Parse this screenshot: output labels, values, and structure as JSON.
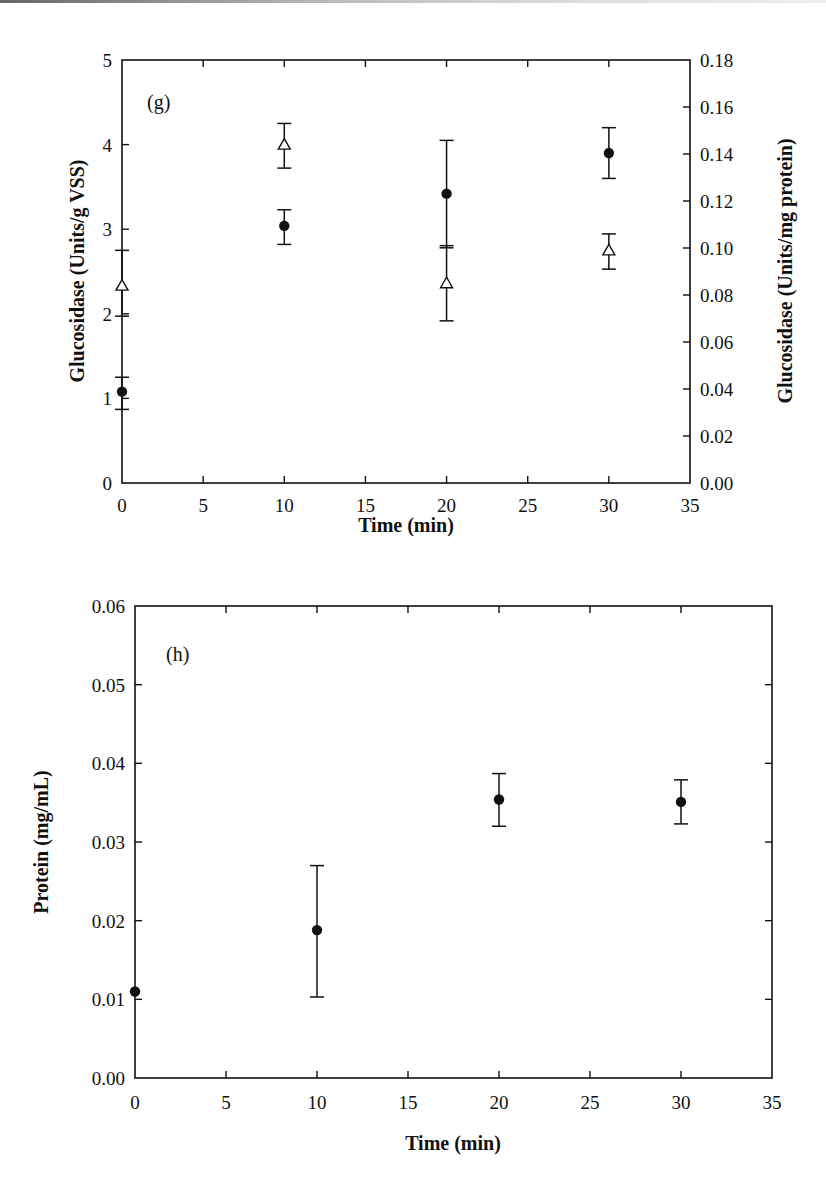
{
  "chart_data": [
    {
      "type": "scatter",
      "panel_label": "(g)",
      "title": "",
      "xlabel": "Time (min)",
      "ylabel": "Glucosidase (Units/g VSS)",
      "y2label": "Glucosidase (Units/mg protein)",
      "xlim": [
        0,
        35
      ],
      "ylim": [
        0,
        5
      ],
      "y2lim": [
        0,
        0.18
      ],
      "x_ticks": [
        "0",
        "5",
        "10",
        "15",
        "20",
        "25",
        "30",
        "35"
      ],
      "y_ticks": [
        "0",
        "1",
        "2",
        "3",
        "4",
        "5"
      ],
      "y2_ticks": [
        "0.00",
        "0.02",
        "0.04",
        "0.06",
        "0.08",
        "0.10",
        "0.12",
        "0.14",
        "0.16",
        "0.18"
      ],
      "grid": false,
      "legend": "none",
      "series": [
        {
          "name": "Glucosidase per g VSS",
          "marker": "filled-circle",
          "axis": "left",
          "x": [
            0,
            10,
            20,
            30
          ],
          "y": [
            1.08,
            3.04,
            3.42,
            3.9
          ],
          "err_high": [
            1.25,
            3.23,
            4.05,
            4.2
          ],
          "err_low": [
            0.87,
            2.82,
            2.78,
            3.6
          ]
        },
        {
          "name": "Glucosidase per mg protein",
          "marker": "open-triangle",
          "axis": "right",
          "x": [
            0,
            10,
            20,
            30
          ],
          "y": [
            0.084,
            0.144,
            0.085,
            0.099
          ],
          "err_high": [
            0.099,
            0.153,
            0.101,
            0.106
          ],
          "err_low": [
            0.071,
            0.134,
            0.069,
            0.091
          ]
        }
      ]
    },
    {
      "type": "scatter",
      "panel_label": "(h)",
      "title": "",
      "xlabel": "Time (min)",
      "ylabel": "Protein (mg/mL)",
      "xlim": [
        0,
        35
      ],
      "ylim": [
        0,
        0.06
      ],
      "x_ticks": [
        "0",
        "5",
        "10",
        "15",
        "20",
        "25",
        "30",
        "35"
      ],
      "y_ticks": [
        "0.00",
        "0.01",
        "0.02",
        "0.03",
        "0.04",
        "0.05",
        "0.06"
      ],
      "grid": false,
      "legend": "none",
      "series": [
        {
          "name": "Protein",
          "marker": "filled-circle",
          "x": [
            0,
            10,
            20,
            30
          ],
          "y": [
            0.011,
            0.0188,
            0.0354,
            0.0351
          ],
          "err_high": [
            null,
            0.027,
            0.0387,
            0.0379
          ],
          "err_low": [
            null,
            0.0103,
            0.032,
            0.0323
          ]
        }
      ]
    }
  ]
}
